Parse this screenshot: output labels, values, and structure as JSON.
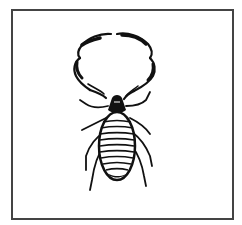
{
  "figure": {
    "style": "black-and-white line art",
    "colors": {
      "ink": "#111111",
      "frame": "#444444",
      "background": "#ffffff"
    }
  }
}
